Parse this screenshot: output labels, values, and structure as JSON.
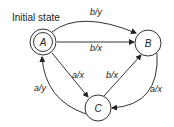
{
  "diagram": {
    "title": "Initial state",
    "states": [
      {
        "id": "A",
        "label": "A",
        "initial": true
      },
      {
        "id": "B",
        "label": "B",
        "initial": false
      },
      {
        "id": "C",
        "label": "C",
        "initial": false
      }
    ],
    "transitions": [
      {
        "from": "A",
        "to": "B",
        "label": "b/y",
        "shape": "curved-top"
      },
      {
        "from": "A",
        "to": "B",
        "label": "b/x",
        "shape": "straight"
      },
      {
        "from": "A",
        "to": "C",
        "label": "a/x",
        "shape": "straight"
      },
      {
        "from": "C",
        "to": "A",
        "label": "a/y",
        "shape": "curved-left"
      },
      {
        "from": "C",
        "to": "B",
        "label": "b/x",
        "shape": "straight"
      },
      {
        "from": "B",
        "to": "C",
        "label": "a/x",
        "shape": "curved-right"
      }
    ]
  }
}
